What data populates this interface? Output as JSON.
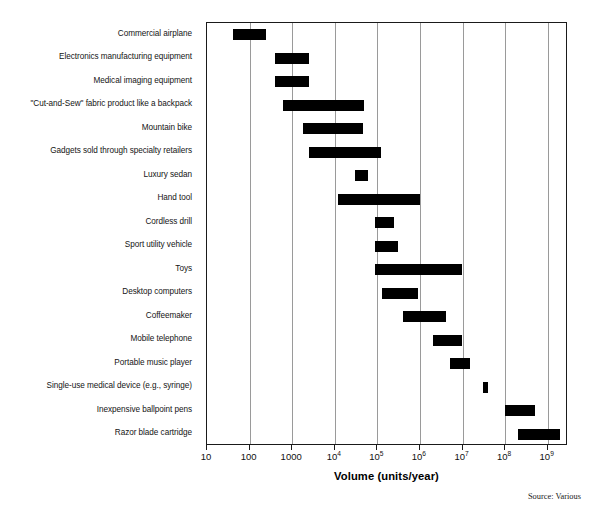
{
  "figure": {
    "axis_title": "Volume (units/year)",
    "source_note": "Source: Various"
  },
  "chart_data": {
    "type": "bar",
    "orientation": "horizontal",
    "subtype": "range-bar (floating bar / span chart)",
    "title": "",
    "subtitle": "",
    "xlabel": "Volume (units/year)",
    "ylabel": "",
    "xscale": "log",
    "xlim": [
      10,
      3000000000
    ],
    "grid": true,
    "grid_axis": "x",
    "legend": null,
    "annotations": [
      "Source: Various"
    ],
    "xticks": [
      10,
      100,
      1000,
      10000,
      100000,
      1000000,
      10000000,
      100000000,
      1000000000
    ],
    "xticklabels": [
      "10",
      "100",
      "1000",
      "10⁴",
      "10⁵",
      "10⁶",
      "10⁷",
      "10⁸",
      "10⁹"
    ],
    "xticklabels_parts": [
      {
        "base": "10",
        "exp": ""
      },
      {
        "base": "100",
        "exp": ""
      },
      {
        "base": "1000",
        "exp": ""
      },
      {
        "base": "10",
        "exp": "4"
      },
      {
        "base": "10",
        "exp": "5"
      },
      {
        "base": "10",
        "exp": "6"
      },
      {
        "base": "10",
        "exp": "7"
      },
      {
        "base": "10",
        "exp": "8"
      },
      {
        "base": "10",
        "exp": "9"
      }
    ],
    "categories": [
      "Commercial airplane",
      "Electronics manufacturing equipment",
      "Medical imaging equipment",
      "\"Cut-and-Sew\" fabric product like a backpack",
      "Mountain bike",
      "Gadgets sold through specialty retailers",
      "Luxury sedan",
      "Hand tool",
      "Cordless drill",
      "Sport utility vehicle",
      "Toys",
      "Desktop computers",
      "Coffeemaker",
      "Mobile telephone",
      "Portable music player",
      "Single-use medical device (e.g., syringe)",
      "Inexpensive ballpoint pens",
      "Razor blade cartridge"
    ],
    "ranges": [
      {
        "category": "Commercial airplane",
        "low": 40,
        "high": 250
      },
      {
        "category": "Electronics manufacturing equipment",
        "low": 400,
        "high": 2500
      },
      {
        "category": "Medical imaging equipment",
        "low": 400,
        "high": 2500
      },
      {
        "category": "\"Cut-and-Sew\" fabric product like a backpack",
        "low": 600,
        "high": 50000
      },
      {
        "category": "Mountain bike",
        "low": 1800,
        "high": 45000
      },
      {
        "category": "Gadgets sold through specialty retailers",
        "low": 2500,
        "high": 120000
      },
      {
        "category": "Luxury sedan",
        "low": 30000,
        "high": 60000
      },
      {
        "category": "Hand tool",
        "low": 12000,
        "high": 1000000
      },
      {
        "category": "Cordless drill",
        "low": 90000,
        "high": 250000
      },
      {
        "category": "Sport utility vehicle",
        "low": 90000,
        "high": 300000
      },
      {
        "category": "Toys",
        "low": 90000,
        "high": 10000000
      },
      {
        "category": "Desktop computers",
        "low": 130000,
        "high": 900000
      },
      {
        "category": "Coffeemaker",
        "low": 400000,
        "high": 4000000
      },
      {
        "category": "Mobile telephone",
        "low": 2000000,
        "high": 10000000
      },
      {
        "category": "Portable music player",
        "low": 5000000,
        "high": 15000000
      },
      {
        "category": "Single-use medical device (e.g., syringe)",
        "low": 30000000,
        "high": 40000000
      },
      {
        "category": "Inexpensive ballpoint pens",
        "low": 100000000,
        "high": 500000000
      },
      {
        "category": "Razor blade cartridge",
        "low": 200000000,
        "high": 2000000000
      }
    ],
    "colors": {
      "bar": "#000000",
      "grid": "#9a9a9a",
      "frame": "#1a1a1a",
      "background": "#ffffff",
      "text": "#111111"
    }
  }
}
